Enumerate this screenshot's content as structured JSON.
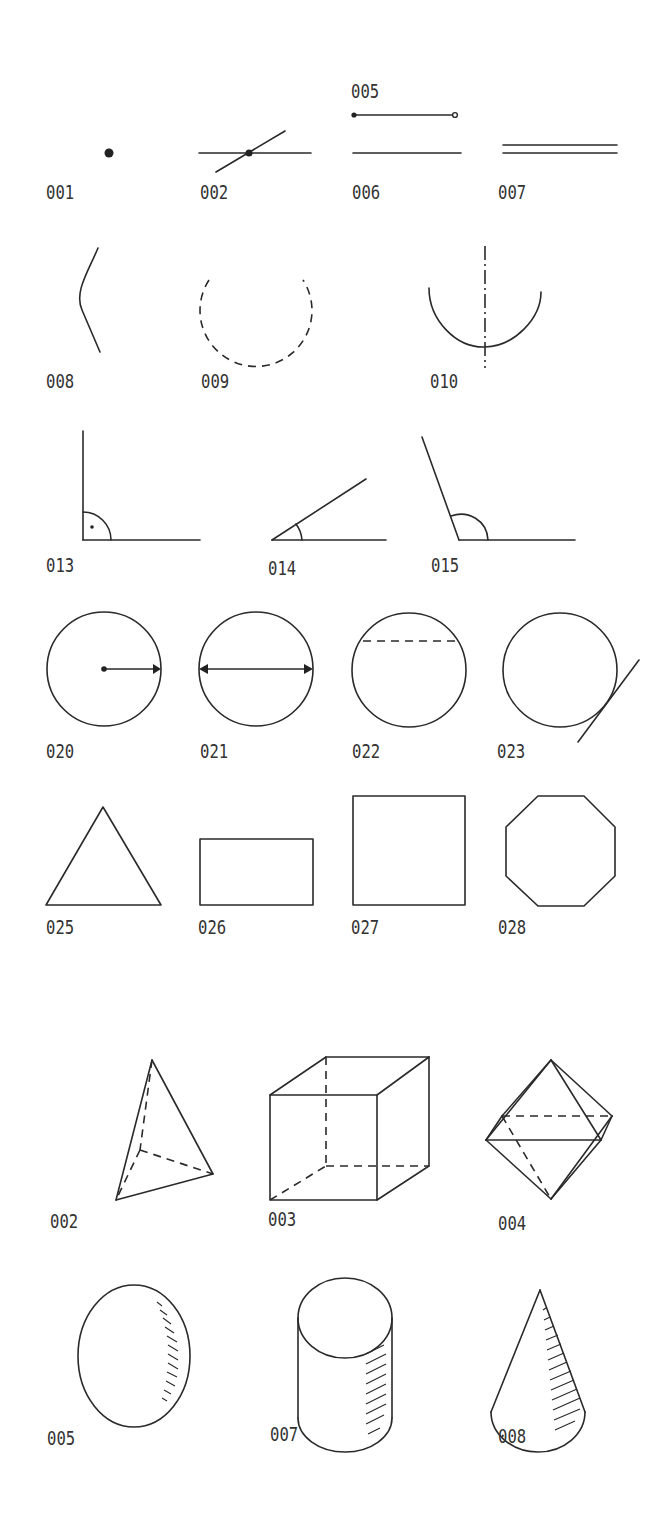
{
  "planar": {
    "row1": [
      {
        "code": "001",
        "figure": "point"
      },
      {
        "code": "002",
        "figure": "intersecting-lines-with-point"
      },
      {
        "code": "005",
        "figure": "line-segment-with-endpoints"
      },
      {
        "code": "006",
        "figure": "straight-line"
      },
      {
        "code": "007",
        "figure": "parallel-lines"
      }
    ],
    "row2": [
      {
        "code": "008",
        "figure": "curved-line"
      },
      {
        "code": "009",
        "figure": "dashed-arc"
      },
      {
        "code": "010",
        "figure": "arc-with-axis"
      }
    ],
    "row3": [
      {
        "code": "013",
        "figure": "right-angle"
      },
      {
        "code": "014",
        "figure": "acute-angle"
      },
      {
        "code": "015",
        "figure": "obtuse-angle"
      }
    ],
    "row4": [
      {
        "code": "020",
        "figure": "circle-radius"
      },
      {
        "code": "021",
        "figure": "circle-diameter"
      },
      {
        "code": "022",
        "figure": "circle-chord"
      },
      {
        "code": "023",
        "figure": "circle-tangent"
      }
    ],
    "row5": [
      {
        "code": "025",
        "figure": "triangle"
      },
      {
        "code": "026",
        "figure": "rectangle"
      },
      {
        "code": "027",
        "figure": "square"
      },
      {
        "code": "028",
        "figure": "octagon"
      }
    ]
  },
  "solids": {
    "row1": [
      {
        "code": "002",
        "figure": "tetrahedron"
      },
      {
        "code": "003",
        "figure": "cuboid"
      },
      {
        "code": "004",
        "figure": "octahedron"
      }
    ],
    "row2": [
      {
        "code": "005",
        "figure": "sphere"
      },
      {
        "code": "007",
        "figure": "cylinder"
      },
      {
        "code": "008",
        "figure": "cone"
      }
    ]
  }
}
